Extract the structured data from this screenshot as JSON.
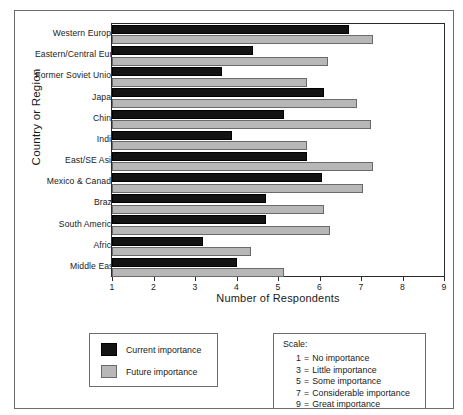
{
  "figure": {
    "y_axis_title": "Country or Region",
    "x_axis_title": "Number of Respondents"
  },
  "legend": {
    "items": [
      {
        "label": "Current importance",
        "color": "#131313",
        "key": "current"
      },
      {
        "label": "Future importance",
        "color": "#b7b7b7",
        "key": "future"
      }
    ]
  },
  "scale": {
    "title": "Scale:",
    "entries": [
      {
        "value": "1",
        "eq": "=",
        "label": "No importance"
      },
      {
        "value": "3",
        "eq": "=",
        "label": "Little importance"
      },
      {
        "value": "5",
        "eq": "=",
        "label": "Some importance"
      },
      {
        "value": "7",
        "eq": "=",
        "label": "Considerable importance"
      },
      {
        "value": "9",
        "eq": "=",
        "label": "Great importance"
      }
    ]
  },
  "chart_data": {
    "type": "bar",
    "orientation": "horizontal",
    "title": "",
    "xlabel": "Number of Respondents",
    "ylabel": "Country or Region",
    "xlim": [
      1,
      9
    ],
    "xticks": [
      "1",
      "2",
      "3",
      "4",
      "5",
      "6",
      "7",
      "8",
      "9"
    ],
    "grid": false,
    "legend_position": "below-left",
    "categories": [
      "Western Europe",
      "Eastern/Central Europe",
      "Former Soviet Union",
      "Japan",
      "China",
      "India",
      "East/SE Asia",
      "Mexico & Canada",
      "Brazil",
      "South America",
      "Africa",
      "Middle East"
    ],
    "series": [
      {
        "name": "Current importance",
        "color": "#131313",
        "values": [
          6.7,
          4.4,
          3.65,
          6.1,
          5.15,
          3.9,
          5.7,
          6.05,
          4.7,
          4.7,
          3.2,
          4.0
        ]
      },
      {
        "name": "Future importance",
        "color": "#b7b7b7",
        "values": [
          7.3,
          6.2,
          5.7,
          6.9,
          7.25,
          5.7,
          7.3,
          7.05,
          6.1,
          6.25,
          4.35,
          5.15
        ]
      }
    ]
  }
}
